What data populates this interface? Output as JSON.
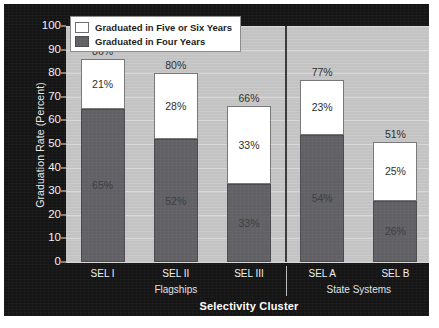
{
  "chart_data": {
    "type": "bar",
    "subtype": "stacked-bar",
    "title": "",
    "xlabel": "Selectivity Cluster",
    "ylabel": "Graduation Rate (Percent)",
    "ylim": [
      0,
      100
    ],
    "ytick_values": [
      0,
      10,
      20,
      30,
      40,
      50,
      60,
      70,
      80,
      90,
      100
    ],
    "ytick_labels": [
      "0",
      "10",
      "20",
      "30",
      "40",
      "50",
      "60",
      "70",
      "80",
      "90",
      "100"
    ],
    "grid": true,
    "grid_axis": "y",
    "legend_position": "upper-left-inside",
    "categories": [
      "SEL I",
      "SEL II",
      "SEL III",
      "SEL A",
      "SEL B"
    ],
    "groups": [
      {
        "label": "Flagships",
        "categories": [
          "SEL I",
          "SEL II",
          "SEL III"
        ]
      },
      {
        "label": "State Systems",
        "categories": [
          "SEL A",
          "SEL B"
        ]
      }
    ],
    "series": [
      {
        "name": "Graduated in Four Years",
        "color": "#606065",
        "values": [
          65,
          52,
          33,
          54,
          26
        ],
        "labels": [
          "65%",
          "52%",
          "33%",
          "54%",
          "26%"
        ]
      },
      {
        "name": "Graduated in Five or Six Years",
        "color": "#ffffff",
        "values": [
          21,
          28,
          33,
          23,
          25
        ],
        "labels": [
          "21%",
          "28%",
          "33%",
          "23%",
          "25%"
        ]
      }
    ],
    "totals": [
      86,
      80,
      66,
      77,
      51
    ],
    "total_labels": [
      "86%",
      "80%",
      "66%",
      "77%",
      "51%"
    ]
  },
  "legend": {
    "items": [
      {
        "label": "Graduated in Five or Six Years",
        "swatch": "white"
      },
      {
        "label": "Graduated in Four Years",
        "swatch": "dark"
      }
    ]
  },
  "colors": {
    "panel_background": "#151515",
    "plot_background": "#c5c5c5",
    "gridline": "#d8d8d8",
    "four_year_bar": "#606065",
    "five_six_bar": "#ffffff",
    "axis_text": "#f0f0f0",
    "divider": "#3a3a3a"
  }
}
